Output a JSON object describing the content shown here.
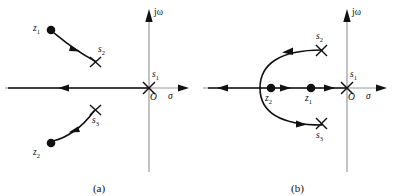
{
  "figure": {
    "panels": [
      {
        "caption": "(a)",
        "axis": {
          "vertical_label": "jω",
          "horizontal_label": "σ",
          "origin_label": "O"
        },
        "poles": [
          {
            "name": "s1",
            "label": "s",
            "sub": "1",
            "marker": "x-marker",
            "x": 149,
            "y": 88
          },
          {
            "name": "s2",
            "label": "s",
            "sub": "2",
            "marker": "x-marker",
            "x": 95,
            "y": 62
          },
          {
            "name": "s3",
            "label": "s",
            "sub": "3",
            "marker": "x-marker",
            "x": 95,
            "y": 110
          }
        ],
        "zeros": [
          {
            "name": "z1",
            "label": "z",
            "sub": "1",
            "marker": "dot-marker",
            "x": 51,
            "y": 30
          },
          {
            "name": "z2",
            "label": "z",
            "sub": "2",
            "marker": "dot-marker",
            "x": 51,
            "y": 143
          }
        ],
        "branches": [
          {
            "name": "branch-upper",
            "from": "z1",
            "to": "s2",
            "arrow": "mid-arrow"
          },
          {
            "name": "branch-lower",
            "from": "z2",
            "to": "s3",
            "arrow": "mid-arrow"
          },
          {
            "name": "branch-real-axis",
            "from": "s1",
            "to": "negative-infinity",
            "arrow": "left-arrow"
          }
        ]
      },
      {
        "caption": "(b)",
        "axis": {
          "vertical_label": "jω",
          "horizontal_label": "σ",
          "origin_label": "O"
        },
        "poles": [
          {
            "name": "s1",
            "label": "s",
            "sub": "1",
            "marker": "x-marker",
            "x": 149,
            "y": 88
          },
          {
            "name": "s2",
            "label": "s",
            "sub": "2",
            "marker": "x-marker",
            "x": 123,
            "y": 51
          },
          {
            "name": "s3",
            "label": "s",
            "sub": "3",
            "marker": "x-marker",
            "x": 123,
            "y": 123
          }
        ],
        "zeros": [
          {
            "name": "z2",
            "label": "z",
            "sub": "2",
            "marker": "dot-marker",
            "x": 73,
            "y": 88
          },
          {
            "name": "z1",
            "label": "z",
            "sub": "1",
            "marker": "dot-marker",
            "x": 113,
            "y": 88
          }
        ],
        "branches": [
          {
            "name": "branch-upper",
            "from": "breakaway",
            "to": "s2",
            "arrow": "mid-arrow"
          },
          {
            "name": "branch-lower",
            "from": "breakaway",
            "to": "s3",
            "arrow": "mid-arrow"
          },
          {
            "name": "branch-real-axis-left",
            "from": "breakaway",
            "to": "negative-infinity",
            "arrow": "left-arrow"
          },
          {
            "name": "branch-real-axis-mid",
            "from": "z2",
            "to": "z1",
            "arrow": "right-arrow"
          },
          {
            "name": "branch-real-axis-origin",
            "from": "s1",
            "to": "z1",
            "arrow": "left-arrow"
          }
        ]
      }
    ]
  },
  "colors": {
    "ink": "#111111",
    "axis": "#8a8a8a",
    "background": "#ffffff"
  }
}
